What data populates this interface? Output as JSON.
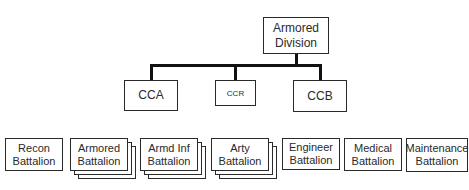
{
  "diagram": {
    "root": {
      "label_line1": "Armored",
      "label_line2": "Division"
    },
    "commands": [
      {
        "label": "CCA"
      },
      {
        "label": "CCR"
      },
      {
        "label": "CCB"
      }
    ],
    "battalions": [
      {
        "line1": "Recon",
        "line2": "Battalion",
        "stacked": false
      },
      {
        "line1": "Armored",
        "line2": "Battalion",
        "stacked": true
      },
      {
        "line1": "Armd Inf",
        "line2": "Battalion",
        "stacked": true
      },
      {
        "line1": "Arty",
        "line2": "Battalion",
        "stacked": true
      },
      {
        "line1": "Engineer",
        "line2": "Battalion",
        "stacked": false
      },
      {
        "line1": "Medical",
        "line2": "Battalion",
        "stacked": false
      },
      {
        "line1": "Maintenance",
        "line2": "Battalion",
        "stacked": false
      }
    ]
  }
}
